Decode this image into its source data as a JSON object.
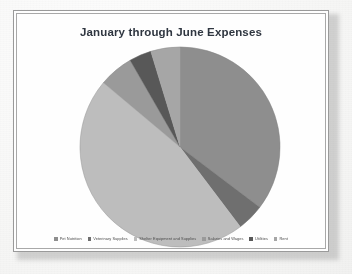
{
  "document": {
    "background_color": "#f5f5f4",
    "frame_border_color": "#9a9a9a",
    "page_surface_color": "#fefefe"
  },
  "chart": {
    "title": "January through June Expenses",
    "title_color": "#2f3640"
  },
  "legend": {
    "position": "bottom",
    "items": [
      {
        "label": "Pet Nutrition",
        "color": "#8e8e8e"
      },
      {
        "label": "Veterinary Supplies",
        "color": "#6f6f6f"
      },
      {
        "label": "Shelter Equipment and Supplies",
        "color": "#bdbdbd"
      },
      {
        "label": "Salaries and Wages",
        "color": "#9a9a9a"
      },
      {
        "label": "Utilities",
        "color": "#585858"
      },
      {
        "label": "Rent",
        "color": "#a6a6a6"
      }
    ]
  },
  "chart_data": {
    "type": "pie",
    "title": "January through June Expenses",
    "xlabel": "",
    "ylabel": "",
    "legend_position": "bottom",
    "grid": false,
    "start_angle_deg": 0,
    "direction": "clockwise",
    "center": {
      "x": 177,
      "y": 144
    },
    "radius": 100,
    "categories": [
      "Pet Nutrition",
      "Veterinary Supplies",
      "Shelter Equipment and Supplies",
      "Salaries and Wages",
      "Utilities",
      "Rent"
    ],
    "values": [
      35.3,
      4.4,
      46.4,
      5.6,
      3.6,
      4.7
    ],
    "units": "percent",
    "slices": [
      {
        "label": "Pet Nutrition",
        "value": 35.3,
        "start_deg": 0.0,
        "end_deg": 127.1,
        "color": "#8e8e8e"
      },
      {
        "label": "Veterinary Supplies",
        "value": 4.4,
        "start_deg": 127.1,
        "end_deg": 142.9,
        "color": "#6f6f6f"
      },
      {
        "label": "Shelter Equipment and Supplies",
        "value": 46.4,
        "start_deg": 142.9,
        "end_deg": 310.0,
        "color": "#bdbdbd"
      },
      {
        "label": "Salaries and Wages",
        "value": 5.6,
        "start_deg": 310.0,
        "end_deg": 330.1,
        "color": "#9a9a9a"
      },
      {
        "label": "Utilities",
        "value": 3.6,
        "start_deg": 330.1,
        "end_deg": 343.0,
        "color": "#585858"
      },
      {
        "label": "Rent",
        "value": 4.7,
        "start_deg": 343.0,
        "end_deg": 360.0,
        "color": "#a6a6a6"
      }
    ]
  }
}
